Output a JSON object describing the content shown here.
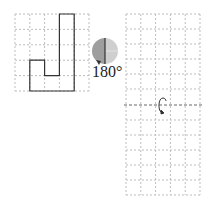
{
  "figure": {
    "left_grid": {
      "cols": 5,
      "rows": 5,
      "shape": "J-shaped polyomino outline"
    },
    "rotation_indicator": {
      "angle_label": "180°",
      "icon": "half-shaded-circle-rotation-icon"
    },
    "right_grid_top": {
      "cols": 5,
      "rows": 5,
      "state": "empty"
    },
    "divider": {
      "icon": "flip-arrow-icon",
      "style": "dashed"
    },
    "right_grid_bottom": {
      "cols": 5,
      "rows": 5,
      "state": "empty"
    }
  },
  "colors": {
    "grid_line": "#bdbdbd",
    "shape_outline": "#333333",
    "circle_dark": "#9e9e9e",
    "circle_light": "#cfcfcf"
  }
}
